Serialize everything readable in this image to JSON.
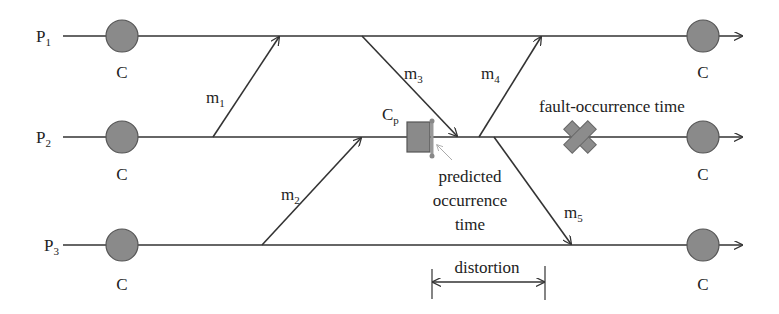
{
  "diagram": {
    "type": "process-timeline",
    "processes": [
      {
        "id": "P1",
        "label": "P",
        "sub": "1",
        "y": 36,
        "checkpoints": [
          {
            "label": "C",
            "x": 122
          },
          {
            "label": "C",
            "x": 703
          }
        ]
      },
      {
        "id": "P2",
        "label": "P",
        "sub": "2",
        "y": 137,
        "checkpoints": [
          {
            "label": "C",
            "x": 122
          },
          {
            "label": "C",
            "x": 703
          }
        ]
      },
      {
        "id": "P3",
        "label": "P",
        "sub": "3",
        "y": 245,
        "checkpoints": [
          {
            "label": "C",
            "x": 122
          },
          {
            "label": "C",
            "x": 703
          }
        ]
      }
    ],
    "messages": [
      {
        "id": "m1",
        "label": "m",
        "sub": "1",
        "from": "P2",
        "to": "P1"
      },
      {
        "id": "m2",
        "label": "m",
        "sub": "2",
        "from": "P3",
        "to": "P2"
      },
      {
        "id": "m3",
        "label": "m",
        "sub": "3",
        "from": "P1",
        "to": "P2"
      },
      {
        "id": "m4",
        "label": "m",
        "sub": "4",
        "from": "P2",
        "to": "P1"
      },
      {
        "id": "m5",
        "label": "m",
        "sub": "5",
        "from": "P2",
        "to": "P3"
      }
    ],
    "predicted_checkpoint": {
      "label": "C",
      "sub": "p"
    },
    "annotations": {
      "fault": "fault-occurrence time",
      "predicted_line1": "predicted",
      "predicted_line2": "occurrence",
      "predicted_line3": "time",
      "distortion": "distortion"
    },
    "colors": {
      "line": "#333333",
      "checkpoint_fill": "#8a8a8a",
      "fault_fill": "#8c8c8c",
      "pointer": "#b0b0b0"
    }
  }
}
